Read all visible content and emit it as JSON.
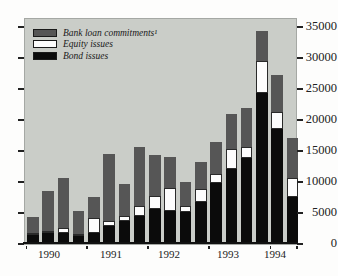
{
  "chart_data": {
    "type": "bar",
    "stacked": true,
    "title": "",
    "categories": [
      "1990 Q1",
      "1990 Q2",
      "1990 Q3",
      "1990 Q4",
      "1991 Q1",
      "1991 Q2",
      "1991 Q3",
      "1991 Q4",
      "1992 Q1",
      "1992 Q2",
      "1992 Q3",
      "1992 Q4",
      "1993 Q1",
      "1993 Q2",
      "1993 Q3",
      "1993 Q4",
      "1994 Q1",
      "1994 Q2"
    ],
    "series": [
      {
        "name": "Bond issues",
        "color": "#0b0b0b",
        "values": [
          1200,
          1450,
          1450,
          900,
          1400,
          2600,
          3450,
          4250,
          5300,
          5050,
          4900,
          6400,
          9450,
          11750,
          13500,
          24100,
          18200,
          7200
        ]
      },
      {
        "name": "Equity issues",
        "color": "#fdfdfd",
        "values": [
          200,
          200,
          800,
          200,
          2450,
          800,
          800,
          1600,
          2050,
          3600,
          950,
          2150,
          1500,
          3200,
          1800,
          5100,
          2700,
          3200
        ]
      },
      {
        "name": "Bank loan commitments¹",
        "color": "#565656",
        "values": [
          2500,
          6450,
          8150,
          3700,
          3350,
          10750,
          5100,
          9400,
          6650,
          5000,
          3850,
          4400,
          5200,
          5650,
          6250,
          4800,
          6000,
          6450
        ]
      }
    ],
    "ylim": [
      0,
      35000
    ],
    "y_ticks": [
      0,
      5000,
      10000,
      15000,
      20000,
      25000,
      30000,
      35000
    ],
    "y_tick_labels": [
      "0",
      "5000",
      "10000",
      "15000",
      "20000",
      "25000",
      "30000",
      "35000"
    ],
    "x_year_labels": [
      "1990",
      "1991",
      "1992",
      "1993",
      "1994"
    ],
    "bars_per_year": [
      4,
      4,
      4,
      4,
      2
    ],
    "legend_position": "top-left",
    "grid": false,
    "y_axis_side": "right"
  },
  "legend": {
    "items": [
      {
        "label": "Bank loan commitments¹",
        "swatch": "dark-gray"
      },
      {
        "label": "Equity issues",
        "swatch": "white"
      },
      {
        "label": "Bond issues",
        "swatch": "black"
      }
    ]
  },
  "colors": {
    "plot_background": "#cacdc8",
    "bank_loan_commitments": "#565656",
    "equity_issues": "#fdfdfd",
    "bond_issues": "#0b0b0b",
    "axis": "#111111",
    "text": "#1a1a1a"
  }
}
